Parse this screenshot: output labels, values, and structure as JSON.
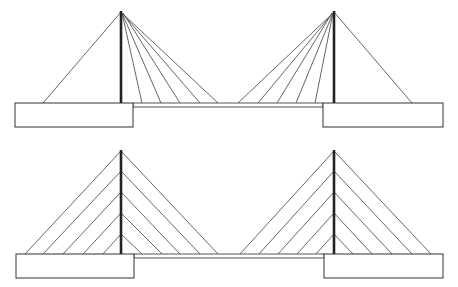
{
  "diagram": {
    "type": "cable-stayed bridge elevations",
    "colors": {
      "background": "#ffffff",
      "line": "#555555",
      "tower": "#222222"
    },
    "bridges": [
      {
        "name": "fan-arrangement",
        "deck": {
          "x1": 133,
          "x2": 323,
          "y_top": 103,
          "y_bottom": 107
        },
        "piers": [
          {
            "x": 15,
            "y": 103,
            "w": 118,
            "h": 24
          },
          {
            "x": 323,
            "y": 103,
            "w": 120,
            "h": 24
          }
        ],
        "towers": [
          {
            "x": 121,
            "top": 11,
            "base": 103,
            "cables": [
              {
                "x1": 121,
                "y1": 12,
                "x2": 43,
                "y2": 103
              },
              {
                "x1": 122,
                "y1": 13,
                "x2": 142,
                "y2": 103
              },
              {
                "x1": 122,
                "y1": 13,
                "x2": 161,
                "y2": 103
              },
              {
                "x1": 123,
                "y1": 13,
                "x2": 180,
                "y2": 103
              },
              {
                "x1": 123,
                "y1": 14,
                "x2": 200,
                "y2": 103
              },
              {
                "x1": 123,
                "y1": 14,
                "x2": 218,
                "y2": 103
              }
            ]
          },
          {
            "x": 334,
            "top": 11,
            "base": 103,
            "cables": [
              {
                "x1": 334,
                "y1": 12,
                "x2": 412,
                "y2": 103
              },
              {
                "x1": 333,
                "y1": 13,
                "x2": 315,
                "y2": 103
              },
              {
                "x1": 333,
                "y1": 13,
                "x2": 296,
                "y2": 103
              },
              {
                "x1": 332,
                "y1": 13,
                "x2": 277,
                "y2": 103
              },
              {
                "x1": 332,
                "y1": 14,
                "x2": 258,
                "y2": 103
              },
              {
                "x1": 332,
                "y1": 14,
                "x2": 238,
                "y2": 103
              }
            ]
          }
        ]
      },
      {
        "name": "harp-arrangement",
        "deck": {
          "x1": 134,
          "x2": 324,
          "y_top": 254,
          "y_bottom": 258
        },
        "piers": [
          {
            "x": 16,
            "y": 254,
            "w": 118,
            "h": 24
          },
          {
            "x": 324,
            "y": 254,
            "w": 119,
            "h": 24
          }
        ],
        "towers": [
          {
            "x": 121,
            "top": 150,
            "base": 254,
            "cables": [
              {
                "x1": 121,
                "y1": 151,
                "x2": 25,
                "y2": 254
              },
              {
                "x1": 121,
                "y1": 171,
                "x2": 43,
                "y2": 254
              },
              {
                "x1": 121,
                "y1": 192,
                "x2": 63,
                "y2": 254
              },
              {
                "x1": 121,
                "y1": 213,
                "x2": 83,
                "y2": 254
              },
              {
                "x1": 121,
                "y1": 234,
                "x2": 103,
                "y2": 254
              },
              {
                "x1": 121,
                "y1": 151,
                "x2": 218,
                "y2": 254
              },
              {
                "x1": 121,
                "y1": 171,
                "x2": 200,
                "y2": 254
              },
              {
                "x1": 121,
                "y1": 192,
                "x2": 180,
                "y2": 254
              },
              {
                "x1": 121,
                "y1": 213,
                "x2": 162,
                "y2": 254
              },
              {
                "x1": 121,
                "y1": 234,
                "x2": 142,
                "y2": 254
              }
            ]
          },
          {
            "x": 334,
            "top": 150,
            "base": 254,
            "cables": [
              {
                "x1": 334,
                "y1": 151,
                "x2": 240,
                "y2": 254
              },
              {
                "x1": 334,
                "y1": 171,
                "x2": 259,
                "y2": 254
              },
              {
                "x1": 334,
                "y1": 192,
                "x2": 278,
                "y2": 254
              },
              {
                "x1": 334,
                "y1": 213,
                "x2": 297,
                "y2": 254
              },
              {
                "x1": 334,
                "y1": 234,
                "x2": 316,
                "y2": 254
              },
              {
                "x1": 334,
                "y1": 151,
                "x2": 431,
                "y2": 254
              },
              {
                "x1": 334,
                "y1": 171,
                "x2": 412,
                "y2": 254
              },
              {
                "x1": 334,
                "y1": 192,
                "x2": 392,
                "y2": 254
              },
              {
                "x1": 334,
                "y1": 213,
                "x2": 372,
                "y2": 254
              },
              {
                "x1": 334,
                "y1": 234,
                "x2": 353,
                "y2": 254
              }
            ]
          }
        ]
      }
    ]
  }
}
